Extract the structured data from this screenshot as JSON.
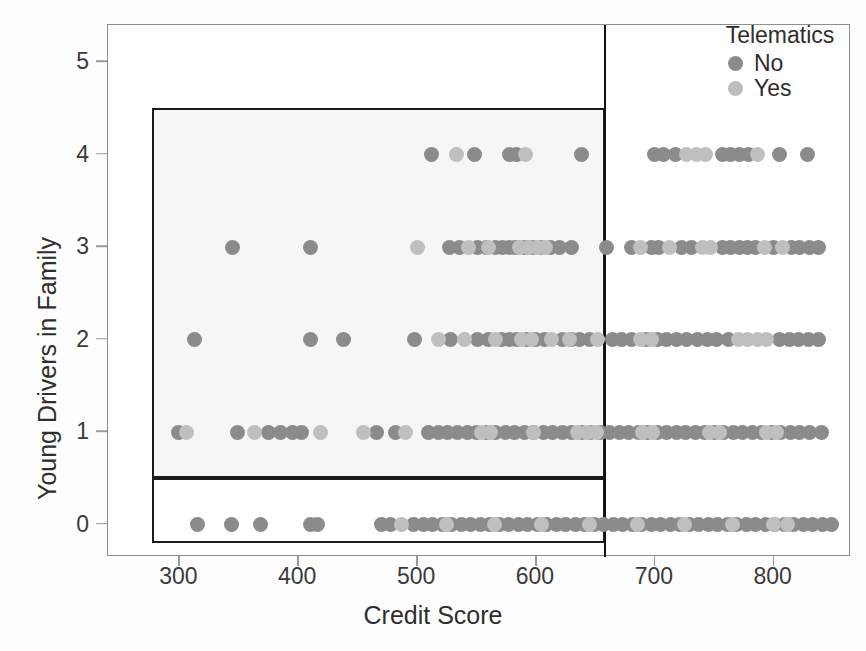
{
  "chart_data": {
    "type": "scatter",
    "title": "",
    "xlabel": "Credit Score",
    "ylabel": "Young Drivers in Family",
    "xlim": [
      240,
      865
    ],
    "ylim": [
      -0.35,
      5.4
    ],
    "xticks": [
      300,
      400,
      500,
      600,
      700,
      800
    ],
    "yticks": [
      0,
      1,
      2,
      3,
      4,
      5
    ],
    "grid": false,
    "legend": {
      "title": "Telematics",
      "position": "top-right",
      "entries": [
        {
          "name": "No",
          "color": "#8b8b8b"
        },
        {
          "name": "Yes",
          "color": "#bdbdbd"
        }
      ]
    },
    "annotations": [
      {
        "kind": "rect",
        "name": "highlight-band-upper",
        "x0": 277,
        "x1": 658,
        "y0": 0.5,
        "y1": 4.5
      },
      {
        "kind": "rect",
        "name": "highlight-band-lower",
        "x0": 277,
        "x1": 658,
        "y0": -0.2,
        "y1": 0.5
      },
      {
        "kind": "vline",
        "name": "split-line",
        "x": 658
      }
    ],
    "series": [
      {
        "name": "No",
        "color": "#8b8b8b",
        "points": [
          [
            512,
            4
          ],
          [
            548,
            4
          ],
          [
            578,
            4
          ],
          [
            584,
            4
          ],
          [
            638,
            4
          ],
          [
            700,
            4
          ],
          [
            707,
            4
          ],
          [
            717,
            4
          ],
          [
            757,
            4
          ],
          [
            764,
            4
          ],
          [
            771,
            4
          ],
          [
            779,
            4
          ],
          [
            805,
            4
          ],
          [
            828,
            4
          ],
          [
            345,
            3
          ],
          [
            410,
            3
          ],
          [
            527,
            3
          ],
          [
            536,
            3
          ],
          [
            551,
            3
          ],
          [
            558,
            3
          ],
          [
            566,
            3
          ],
          [
            572,
            3
          ],
          [
            578,
            3
          ],
          [
            583,
            3
          ],
          [
            590,
            3
          ],
          [
            597,
            3
          ],
          [
            604,
            3
          ],
          [
            612,
            3
          ],
          [
            620,
            3
          ],
          [
            630,
            3
          ],
          [
            659,
            3
          ],
          [
            680,
            3
          ],
          [
            697,
            3
          ],
          [
            703,
            3
          ],
          [
            722,
            3
          ],
          [
            731,
            3
          ],
          [
            757,
            3
          ],
          [
            764,
            3
          ],
          [
            771,
            3
          ],
          [
            778,
            3
          ],
          [
            785,
            3
          ],
          [
            800,
            3
          ],
          [
            815,
            3
          ],
          [
            822,
            3
          ],
          [
            830,
            3
          ],
          [
            838,
            3
          ],
          [
            313,
            2
          ],
          [
            410,
            2
          ],
          [
            438,
            2
          ],
          [
            498,
            2
          ],
          [
            528,
            2
          ],
          [
            551,
            2
          ],
          [
            560,
            2
          ],
          [
            571,
            2
          ],
          [
            578,
            2
          ],
          [
            584,
            2
          ],
          [
            592,
            2
          ],
          [
            600,
            2
          ],
          [
            607,
            2
          ],
          [
            622,
            2
          ],
          [
            630,
            2
          ],
          [
            637,
            2
          ],
          [
            645,
            2
          ],
          [
            664,
            2
          ],
          [
            672,
            2
          ],
          [
            680,
            2
          ],
          [
            693,
            2
          ],
          [
            702,
            2
          ],
          [
            710,
            2
          ],
          [
            718,
            2
          ],
          [
            727,
            2
          ],
          [
            736,
            2
          ],
          [
            744,
            2
          ],
          [
            752,
            2
          ],
          [
            762,
            2
          ],
          [
            805,
            2
          ],
          [
            813,
            2
          ],
          [
            821,
            2
          ],
          [
            829,
            2
          ],
          [
            838,
            2
          ],
          [
            299,
            1
          ],
          [
            349,
            1
          ],
          [
            375,
            1
          ],
          [
            385,
            1
          ],
          [
            395,
            1
          ],
          [
            403,
            1
          ],
          [
            466,
            1
          ],
          [
            482,
            1
          ],
          [
            510,
            1
          ],
          [
            518,
            1
          ],
          [
            526,
            1
          ],
          [
            534,
            1
          ],
          [
            542,
            1
          ],
          [
            550,
            1
          ],
          [
            558,
            1
          ],
          [
            566,
            1
          ],
          [
            574,
            1
          ],
          [
            582,
            1
          ],
          [
            590,
            1
          ],
          [
            598,
            1
          ],
          [
            606,
            1
          ],
          [
            614,
            1
          ],
          [
            622,
            1
          ],
          [
            630,
            1
          ],
          [
            638,
            1
          ],
          [
            646,
            1
          ],
          [
            654,
            1
          ],
          [
            662,
            1
          ],
          [
            670,
            1
          ],
          [
            678,
            1
          ],
          [
            686,
            1
          ],
          [
            694,
            1
          ],
          [
            702,
            1
          ],
          [
            710,
            1
          ],
          [
            718,
            1
          ],
          [
            726,
            1
          ],
          [
            734,
            1
          ],
          [
            742,
            1
          ],
          [
            750,
            1
          ],
          [
            758,
            1
          ],
          [
            766,
            1
          ],
          [
            774,
            1
          ],
          [
            782,
            1
          ],
          [
            790,
            1
          ],
          [
            798,
            1
          ],
          [
            806,
            1
          ],
          [
            814,
            1
          ],
          [
            822,
            1
          ],
          [
            830,
            1
          ],
          [
            840,
            1
          ],
          [
            315,
            0
          ],
          [
            344,
            0
          ],
          [
            368,
            0
          ],
          [
            410,
            0
          ],
          [
            416,
            0
          ],
          [
            470,
            0
          ],
          [
            478,
            0
          ],
          [
            497,
            0
          ],
          [
            505,
            0
          ],
          [
            513,
            0
          ],
          [
            521,
            0
          ],
          [
            529,
            0
          ],
          [
            537,
            0
          ],
          [
            545,
            0
          ],
          [
            553,
            0
          ],
          [
            561,
            0
          ],
          [
            569,
            0
          ],
          [
            577,
            0
          ],
          [
            585,
            0
          ],
          [
            593,
            0
          ],
          [
            601,
            0
          ],
          [
            609,
            0
          ],
          [
            617,
            0
          ],
          [
            625,
            0
          ],
          [
            633,
            0
          ],
          [
            641,
            0
          ],
          [
            649,
            0
          ],
          [
            657,
            0
          ],
          [
            665,
            0
          ],
          [
            673,
            0
          ],
          [
            681,
            0
          ],
          [
            689,
            0
          ],
          [
            697,
            0
          ],
          [
            705,
            0
          ],
          [
            713,
            0
          ],
          [
            721,
            0
          ],
          [
            729,
            0
          ],
          [
            737,
            0
          ],
          [
            745,
            0
          ],
          [
            753,
            0
          ],
          [
            761,
            0
          ],
          [
            769,
            0
          ],
          [
            777,
            0
          ],
          [
            785,
            0
          ],
          [
            793,
            0
          ],
          [
            801,
            0
          ],
          [
            809,
            0
          ],
          [
            817,
            0
          ],
          [
            825,
            0
          ],
          [
            833,
            0
          ],
          [
            841,
            0
          ],
          [
            849,
            0
          ]
        ]
      },
      {
        "name": "Yes",
        "color": "#bfbfbf",
        "points": [
          [
            533,
            4
          ],
          [
            591,
            4
          ],
          [
            727,
            4
          ],
          [
            735,
            4
          ],
          [
            743,
            4
          ],
          [
            786,
            4
          ],
          [
            500,
            3
          ],
          [
            543,
            3
          ],
          [
            560,
            3
          ],
          [
            586,
            3
          ],
          [
            594,
            3
          ],
          [
            601,
            3
          ],
          [
            608,
            3
          ],
          [
            688,
            3
          ],
          [
            712,
            3
          ],
          [
            740,
            3
          ],
          [
            747,
            3
          ],
          [
            792,
            3
          ],
          [
            807,
            3
          ],
          [
            518,
            2
          ],
          [
            540,
            2
          ],
          [
            566,
            2
          ],
          [
            588,
            2
          ],
          [
            596,
            2
          ],
          [
            613,
            2
          ],
          [
            628,
            2
          ],
          [
            652,
            2
          ],
          [
            688,
            2
          ],
          [
            697,
            2
          ],
          [
            770,
            2
          ],
          [
            778,
            2
          ],
          [
            786,
            2
          ],
          [
            794,
            2
          ],
          [
            306,
            1
          ],
          [
            363,
            1
          ],
          [
            419,
            1
          ],
          [
            455,
            1
          ],
          [
            490,
            1
          ],
          [
            554,
            1
          ],
          [
            562,
            1
          ],
          [
            598,
            1
          ],
          [
            635,
            1
          ],
          [
            643,
            1
          ],
          [
            651,
            1
          ],
          [
            690,
            1
          ],
          [
            698,
            1
          ],
          [
            746,
            1
          ],
          [
            754,
            1
          ],
          [
            794,
            1
          ],
          [
            802,
            1
          ],
          [
            487,
            0
          ],
          [
            525,
            0
          ],
          [
            565,
            0
          ],
          [
            605,
            0
          ],
          [
            645,
            0
          ],
          [
            685,
            0
          ],
          [
            725,
            0
          ],
          [
            765,
            0
          ],
          [
            800,
            0
          ],
          [
            812,
            0
          ]
        ]
      }
    ]
  }
}
